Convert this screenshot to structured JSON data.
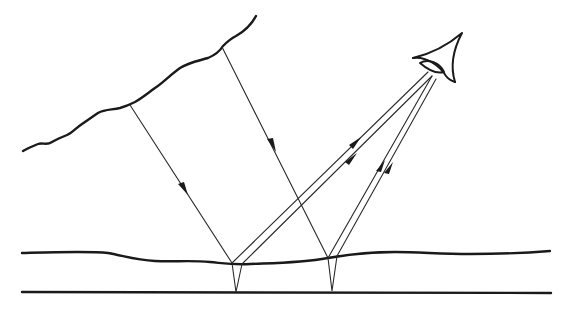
{
  "diagram": {
    "title": "",
    "colors": {
      "stroke": "#1a1a1a",
      "background": "#ffffff"
    },
    "elements": {
      "sky_boundary": {
        "label": "",
        "shape": "wavy line"
      },
      "water_surface": {
        "label": "",
        "shape": "gently wavy line"
      },
      "bottom_layer": {
        "label": "",
        "shape": "straight line"
      },
      "eye": {
        "label": "",
        "icon": "eye-icon"
      },
      "incident_rays": [
        {
          "id": "ray-1",
          "from": [
            133,
            107
          ],
          "to": [
            232,
            263
          ],
          "arrows": 1
        },
        {
          "id": "ray-2",
          "from": [
            221,
            46
          ],
          "to": [
            328,
            258
          ],
          "arrows": 1
        }
      ],
      "reflected_ray_pairs": [
        {
          "id": "pair-left",
          "origin": "left reflection point",
          "arrows": 2
        },
        {
          "id": "pair-right",
          "origin": "right reflection point",
          "arrows": 2
        }
      ]
    }
  }
}
